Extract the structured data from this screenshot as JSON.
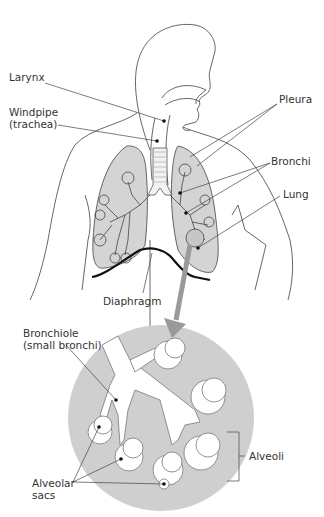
{
  "diagram": {
    "colors": {
      "outline": "#555555",
      "lung_fill": "#d4d4d4",
      "magnified_circle": "#cfcfcf",
      "arrow": "#9a9a9a",
      "diaphragm": "#111111",
      "label_text": "#333333"
    },
    "labels": {
      "larynx": "Larynx",
      "windpipe_line1": "Windpipe",
      "windpipe_line2": "(trachea)",
      "pleura": "Pleura",
      "bronchi": "Bronchi",
      "lung": "Lung",
      "diaphragm": "Diaphragm",
      "bronchiole_line1": "Bronchiole",
      "bronchiole_line2": "(small bronchi)",
      "alveoli": "Alveoli",
      "alveolar_line1": "Alveolar",
      "alveolar_line2": "sacs"
    }
  }
}
